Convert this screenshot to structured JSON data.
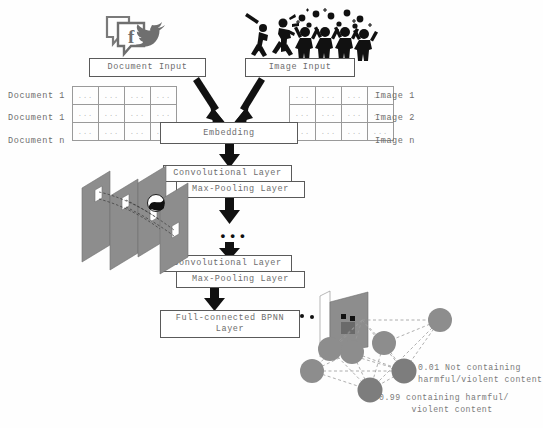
{
  "figure": {
    "type": "architecture-diagram",
    "background_color": "#fefefe",
    "line_color": "#5a5a5a",
    "text_color": "#6d6d6d",
    "arrow_color": "#111111",
    "node_color": "#8a8a8a",
    "plane_color": "#8d8d8d"
  },
  "icons": {
    "social": "facebook-twitter-icon",
    "violence": "violence-riot-icon"
  },
  "inputs": {
    "document_box": "Document Input",
    "image_box": "Image Input"
  },
  "document_table": {
    "rows": [
      {
        "label": "Document 1",
        "cells": [
          "...",
          "...",
          "...",
          "..."
        ]
      },
      {
        "label": "Document 1",
        "cells": [
          "...",
          "...",
          "...",
          "..."
        ]
      },
      {
        "label": "Document n",
        "cells": [
          "...",
          "...",
          "...",
          "..."
        ]
      }
    ]
  },
  "image_table": {
    "rows": [
      {
        "label": "Image 1",
        "cells": [
          "...",
          "...",
          "...",
          "..."
        ]
      },
      {
        "label": "Image 2",
        "cells": [
          "...",
          "...",
          "...",
          "..."
        ]
      },
      {
        "label": "Image n",
        "cells": [
          "...",
          "...",
          "...",
          "..."
        ]
      }
    ]
  },
  "pipeline": {
    "embedding": "Embedding",
    "conv1": "Convolutional Layer",
    "pool1": "Max-Pooling Layer",
    "ellipsis": "•••",
    "conv2": "Convolutional Layer",
    "pool2": "Max-Pooling Layer",
    "fc": "Full-connected BPNN\nLayer"
  },
  "outputs": {
    "negative": "0.01 Not containing\nharmful/violent content",
    "positive": "0.99 containing harmful/\n      violent content",
    "negative_score": "0.01",
    "positive_score": "0.99"
  }
}
